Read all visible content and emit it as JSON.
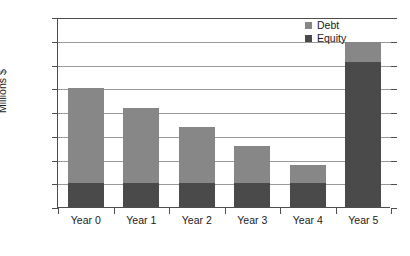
{
  "chart_data": {
    "type": "bar",
    "subtype": "stacked-bar",
    "title": "",
    "xlabel": "",
    "ylabel": "Millions $",
    "ylim": [
      0,
      800
    ],
    "ytick_step": 100,
    "yticks": [
      0,
      100,
      200,
      300,
      400,
      500,
      600,
      700,
      800
    ],
    "ytick_labels": [
      "0",
      "100",
      "200",
      "300",
      "400",
      "500",
      "600",
      "700",
      "800"
    ],
    "grid": true,
    "grid_axis": "y",
    "legend_position": "top-right",
    "categories": [
      "Year 0",
      "Year 1",
      "Year 2",
      "Year 3",
      "Year 4",
      "Year 5"
    ],
    "series": [
      {
        "name": "Debt",
        "color": "#878787",
        "values": [
          400,
          315,
          235,
          155,
          75,
          85
        ]
      },
      {
        "name": "Equity",
        "color": "#4a4a4a",
        "values": [
          100,
          100,
          100,
          100,
          100,
          610
        ]
      }
    ],
    "totals": [
      500,
      415,
      335,
      255,
      175,
      695
    ],
    "stack_order_bottom_to_top": [
      [
        "Equity",
        "Debt"
      ],
      [
        "Equity",
        "Debt"
      ],
      [
        "Equity",
        "Debt"
      ],
      [
        "Equity",
        "Debt"
      ],
      [
        "Equity",
        "Debt"
      ],
      [
        "Equity",
        "Debt"
      ]
    ]
  },
  "legend": {
    "entries": [
      {
        "label": "Debt",
        "color": "#878787"
      },
      {
        "label": "Equity",
        "color": "#4a4a4a"
      }
    ]
  },
  "axes": {
    "y_title": "Millions $"
  }
}
